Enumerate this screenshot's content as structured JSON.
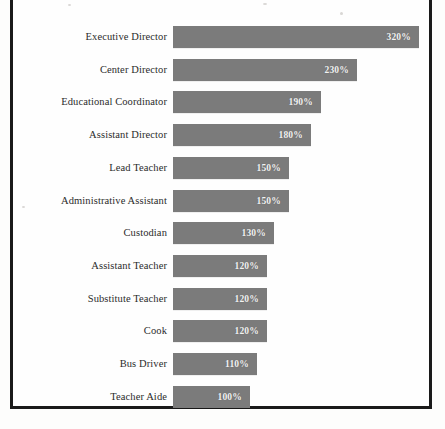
{
  "figure": {
    "frame_color": "#1a1a1a",
    "background_color": "#fefefe"
  },
  "chart_data": {
    "type": "bar",
    "orientation": "horizontal",
    "title": "",
    "subtitle": "",
    "xlabel": "",
    "ylabel": "",
    "grid": false,
    "legend": null,
    "axis_visible": false,
    "xlim": [
      0,
      320
    ],
    "value_suffix": "%",
    "bar_color": "#7b7b7b",
    "label_color": "#f2f2f2",
    "categories": [
      "Executive Director",
      "Center Director",
      "Educational Coordinator",
      "Assistant Director",
      "Lead Teacher",
      "Administrative Assistant",
      "Custodian",
      "Assistant Teacher",
      "Substitute Teacher",
      "Cook",
      "Bus Driver",
      "Teacher Aide"
    ],
    "values": [
      320,
      230,
      190,
      180,
      150,
      150,
      130,
      120,
      120,
      120,
      110,
      100
    ],
    "value_labels": [
      "320%",
      "230%",
      "190%",
      "180%",
      "150%",
      "150%",
      "130%",
      "120%",
      "120%",
      "120%",
      "110%",
      "100%"
    ],
    "bar_pixel_widths": [
      246,
      184,
      148,
      138,
      116,
      116,
      101,
      94,
      94,
      94,
      84,
      77
    ]
  }
}
